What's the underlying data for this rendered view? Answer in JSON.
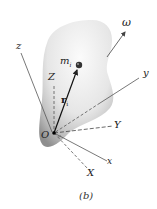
{
  "figure": {
    "caption": "(b)",
    "body_color_light": "#f2f2f2",
    "body_color_dark": "#9a9a9a",
    "labels": {
      "omega": "ω",
      "z_body": "z",
      "y_body": "y",
      "x_body": "x",
      "Z_fixed": "Z",
      "Y_fixed": "Y",
      "X_fixed": "X",
      "mass": "m",
      "mass_sub": "i",
      "position_vector": "r",
      "position_sub": "i",
      "origin": "O"
    }
  }
}
